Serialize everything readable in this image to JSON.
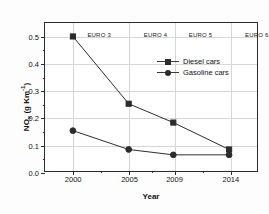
{
  "chart_data": {
    "type": "line",
    "title": "",
    "xlabel": "Year",
    "ylabel": "NO",
    "ylabel_sub": "x",
    "ylabel_units": " (g Km",
    "ylabel_sup": "-1",
    "ylabel_close": ")",
    "x": [
      2000,
      2005,
      2009,
      2014
    ],
    "xticklabels": [
      "2000",
      "2005",
      "2009",
      "2014"
    ],
    "yticklabels": [
      "0.0",
      "0.1",
      "0.2",
      "0.3",
      "0.4",
      "0.5"
    ],
    "ytickvalues": [
      0.0,
      0.1,
      0.2,
      0.3,
      0.4,
      0.5
    ],
    "xlim": [
      1997.5,
      2016.5
    ],
    "ylim": [
      0.0,
      0.55
    ],
    "grid": true,
    "legend_position": "upper-right-inside",
    "series": [
      {
        "name": "Diesel cars",
        "marker": "square",
        "color": "#2b2b2b",
        "values": [
          0.5,
          0.25,
          0.18,
          0.08
        ]
      },
      {
        "name": "Gasoline cars",
        "marker": "circle",
        "color": "#2b2b2b",
        "values": [
          0.15,
          0.08,
          0.06,
          0.06
        ]
      }
    ],
    "annotations": [
      {
        "label": "EURO 3",
        "x": 2000
      },
      {
        "label": "EURO 4",
        "x": 2005
      },
      {
        "label": "EURO 5",
        "x": 2009
      },
      {
        "label": "EURO 6",
        "x": 2014
      }
    ]
  },
  "legend": {
    "items": [
      {
        "label": "Diesel cars"
      },
      {
        "label": "Gasoline cars"
      }
    ]
  }
}
